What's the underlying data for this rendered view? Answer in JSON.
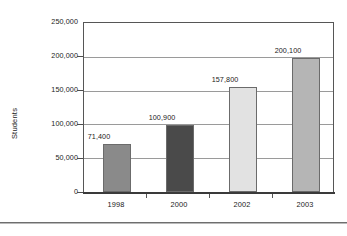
{
  "chart_data": {
    "type": "bar",
    "title": "",
    "xlabel": "",
    "ylabel": "Students",
    "categories": [
      "1998",
      "2000",
      "2002",
      "2003"
    ],
    "values": [
      71400,
      100900,
      157800,
      200100
    ],
    "value_labels": [
      "71,400",
      "100,900",
      "157,800",
      "200,100"
    ],
    "bar_colors": [
      "#8a8a8a",
      "#4a4a4a",
      "#e2e2e2",
      "#b5b5b5"
    ],
    "ylim": [
      0,
      250000
    ],
    "ytick_values": [
      0,
      50000,
      100000,
      150000,
      200000,
      250000
    ],
    "ytick_labels": [
      "0",
      "50,000",
      "100,000",
      "150,000",
      "200,000",
      "250,000"
    ],
    "grid": true,
    "grid_axis": "y",
    "legend": false,
    "legend_position": "none"
  }
}
